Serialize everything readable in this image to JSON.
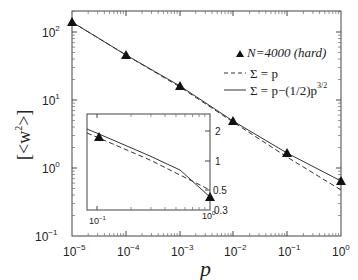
{
  "chart_data": {
    "type": "line",
    "title": "",
    "xlabel": "p",
    "ylabel": "[<w^2>]",
    "xscale": "log",
    "yscale": "log",
    "xlim": [
      1e-05,
      1
    ],
    "ylim": [
      0.1,
      205
    ],
    "x_ticks": [
      "10^-5",
      "10^-4",
      "10^-3",
      "10^-2",
      "10^-1",
      "10^0"
    ],
    "y_ticks": [
      "10^-1",
      "10^0",
      "10^1",
      "10^2"
    ],
    "grid": false,
    "legend_position": "upper right",
    "series": [
      {
        "name": "N=4000 (hard)",
        "style": "filled-triangle markers",
        "x": [
          1e-05,
          0.0001,
          0.001,
          0.01,
          0.1,
          1
        ],
        "y": [
          140,
          46,
          16,
          4.9,
          1.66,
          0.65
        ]
      },
      {
        "name": "Σ = p",
        "style": "dashed line",
        "x": [
          1e-05,
          0.0001,
          0.001,
          0.01,
          0.1,
          1
        ],
        "y": [
          140,
          46,
          15.5,
          4.7,
          1.5,
          0.47
        ]
      },
      {
        "name": "Σ = p−(1/2)p^{3/2}",
        "style": "solid line",
        "x": [
          1e-05,
          0.0001,
          0.001,
          0.01,
          0.1,
          1
        ],
        "y": [
          140,
          46,
          16,
          4.9,
          1.66,
          0.67
        ]
      }
    ],
    "inset": {
      "xlim": [
        0.08,
        1
      ],
      "ylim": [
        0.3,
        2.6
      ],
      "x_ticks": [
        "10^-1",
        "10^0"
      ],
      "y_ticks": [
        "0.3",
        "0.5",
        "1",
        "2"
      ],
      "y_axis_side": "right",
      "points": {
        "x": [
          0.1,
          1
        ],
        "y": [
          1.66,
          0.65
        ]
      }
    }
  },
  "labels": {
    "xlabel": "p",
    "ylabel_main": "[<w",
    "ylabel_sup": "2",
    "ylabel_end": ">]",
    "legend": {
      "item1_n": "N=4000 (hard)",
      "item2": "Σ = p",
      "item3": "Σ = p−(1/2)p",
      "item3_sup": "3/2"
    },
    "xticks": [
      {
        "base": "10",
        "exp": "−5"
      },
      {
        "base": "10",
        "exp": "−4"
      },
      {
        "base": "10",
        "exp": "−3"
      },
      {
        "base": "10",
        "exp": "−2"
      },
      {
        "base": "10",
        "exp": "−1"
      },
      {
        "base": "10",
        "exp": "0"
      }
    ],
    "yticks": [
      {
        "base": "10",
        "exp": "2"
      },
      {
        "base": "10",
        "exp": "1"
      },
      {
        "base": "10",
        "exp": "0"
      },
      {
        "base": "10",
        "exp": "−1"
      }
    ],
    "inset_xticks": [
      {
        "base": "10",
        "exp": "−1"
      },
      {
        "base": "10",
        "exp": "0"
      }
    ],
    "inset_yticks": [
      "2",
      "1",
      "0.5",
      "0.3"
    ]
  }
}
